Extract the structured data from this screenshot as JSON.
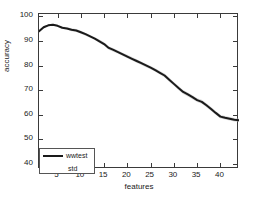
{
  "chart_data": {
    "type": "line",
    "title": "",
    "xlabel": "features",
    "ylabel": "accuracy",
    "xlim": [
      1,
      44
    ],
    "ylim": [
      38,
      101
    ],
    "grid": false,
    "xticks": [
      5,
      10,
      15,
      20,
      25,
      30,
      35,
      40
    ],
    "yticks": [
      40,
      50,
      60,
      70,
      80,
      90,
      100
    ],
    "legend": {
      "position": "lower-left",
      "entries": [
        {
          "label": "wwtest",
          "style": "solid-line",
          "color": "#1a1a1a"
        },
        {
          "label": "std",
          "style": "band",
          "color": "#b4b4b4"
        }
      ]
    },
    "x": [
      1,
      2,
      3,
      4,
      5,
      6,
      7,
      8,
      9,
      10,
      11,
      12,
      13,
      14,
      15,
      16,
      17,
      18,
      19,
      20,
      21,
      22,
      23,
      24,
      25,
      26,
      27,
      28,
      29,
      30,
      31,
      32,
      33,
      34,
      35,
      36,
      37,
      38,
      39,
      40,
      41,
      42,
      43,
      44
    ],
    "series": [
      {
        "name": "wwtest",
        "values": [
          94.0,
          95.6,
          96.4,
          96.6,
          96.2,
          95.4,
          95.1,
          94.6,
          94.3,
          93.6,
          92.8,
          91.9,
          91.0,
          89.9,
          88.8,
          87.2,
          86.4,
          85.5,
          84.6,
          83.7,
          82.8,
          81.9,
          81.0,
          80.1,
          79.2,
          78.2,
          77.1,
          76.0,
          74.3,
          72.6,
          70.9,
          69.3,
          68.3,
          67.2,
          66.0,
          65.3,
          63.9,
          62.4,
          60.8,
          59.3,
          58.8,
          58.4,
          58.0,
          57.8
        ]
      },
      {
        "name": "std",
        "values": [
          0.6,
          0.5,
          0.4,
          0.4,
          0.4,
          0.5,
          0.5,
          0.6,
          0.6,
          0.6,
          0.6,
          0.6,
          0.6,
          0.7,
          0.7,
          0.7,
          0.7,
          0.7,
          0.7,
          0.7,
          0.7,
          0.7,
          0.7,
          0.7,
          0.7,
          0.7,
          0.7,
          0.8,
          0.8,
          0.8,
          0.8,
          0.8,
          0.8,
          0.8,
          0.8,
          0.8,
          0.8,
          0.8,
          0.8,
          0.8,
          0.7,
          0.7,
          0.7,
          0.7
        ]
      }
    ],
    "colors": {
      "line": "#1a1a1a",
      "band": "#b4b4b4",
      "axis": "#3a3a3a",
      "background": "#ffffff"
    }
  }
}
